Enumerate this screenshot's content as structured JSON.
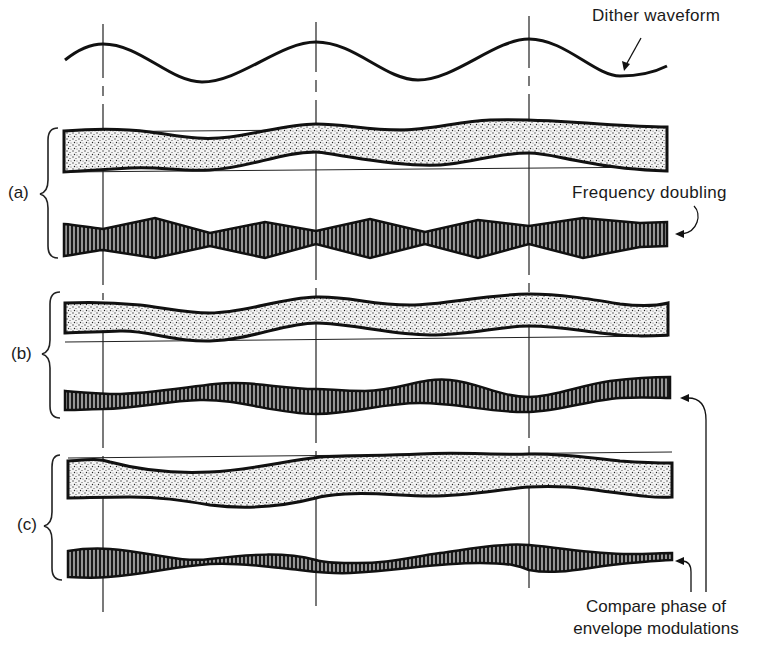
{
  "figure": {
    "annotations": {
      "dither_waveform": "Dither waveform",
      "frequency_doubling": "Frequency doubling",
      "compare_phase_line1": "Compare phase of",
      "compare_phase_line2": "envelope modulations"
    },
    "groups": [
      {
        "id": "a",
        "label": "(a)"
      },
      {
        "id": "b",
        "label": "(b)"
      },
      {
        "id": "c",
        "label": "(c)"
      }
    ],
    "reference_lines_x": [
      103,
      316,
      529
    ],
    "colors": {
      "ink": "#141414",
      "stipple": "#555555",
      "background": "#ffffff"
    }
  }
}
